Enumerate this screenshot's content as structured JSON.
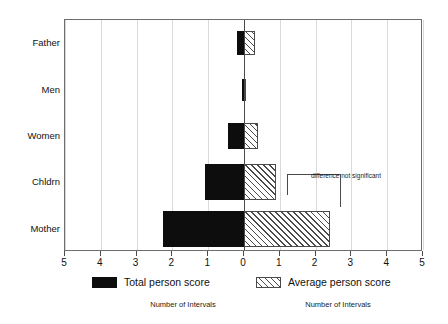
{
  "chart_data": {
    "type": "bar",
    "title": "",
    "subtitle": "",
    "orientation": "horizontal",
    "grid": true,
    "categories": [
      "Father",
      "Men",
      "Women",
      "Chldrn",
      "Mother"
    ],
    "series": [
      {
        "name": "Total person score",
        "direction": "left",
        "fill": "solid-black",
        "values": [
          0.2,
          0.05,
          0.45,
          1.1,
          2.25
        ]
      },
      {
        "name": "Average person score",
        "direction": "right",
        "fill": "diagonal-hatch",
        "values": [
          0.3,
          0.05,
          0.4,
          0.9,
          2.4
        ]
      }
    ],
    "xlabel_left": "Number of Intervals",
    "xlabel_right": "Number of Intervals",
    "ylabel": "",
    "xlim": [
      -5,
      5
    ],
    "xticks": [
      -5,
      -4,
      -3,
      -2,
      -1,
      0,
      1,
      2,
      3,
      4,
      5
    ],
    "xtick_labels": [
      "5",
      "4",
      "3",
      "2",
      "1",
      "0",
      "1",
      "2",
      "3",
      "4",
      "5"
    ],
    "legend_position": "bottom",
    "annotations": [
      {
        "text": "difference not significant",
        "target_categories": [
          "Chldrn",
          "Mother"
        ]
      }
    ]
  },
  "axes": {
    "y_categories": [
      {
        "label": "Father"
      },
      {
        "label": "Men"
      },
      {
        "label": "Women"
      },
      {
        "label": "Chldrn"
      },
      {
        "label": "Mother"
      }
    ],
    "x_ticks": [
      {
        "label": "5",
        "value": -5
      },
      {
        "label": "4",
        "value": -4
      },
      {
        "label": "3",
        "value": -3
      },
      {
        "label": "2",
        "value": -2
      },
      {
        "label": "1",
        "value": -1
      },
      {
        "label": "0",
        "value": 0
      },
      {
        "label": "1",
        "value": 1
      },
      {
        "label": "2",
        "value": 2
      },
      {
        "label": "3",
        "value": 3
      },
      {
        "label": "4",
        "value": 4
      },
      {
        "label": "5",
        "value": 5
      }
    ]
  },
  "legend": {
    "items": [
      {
        "label": "Total person score",
        "fill": "solid"
      },
      {
        "label": "Average person score",
        "fill": "hatch"
      }
    ]
  },
  "footer": {
    "left_title": "Number of Intervals",
    "right_title": "Number of Intervals"
  },
  "annotation": {
    "text": "difference not significant"
  },
  "colors": {
    "solid_fill": "#0d0d0d",
    "hatch_stroke": "#4a4a4a",
    "grid": "#d9d9d9",
    "axis": "#6e6e6e",
    "text": "#111111",
    "background": "#ffffff"
  }
}
